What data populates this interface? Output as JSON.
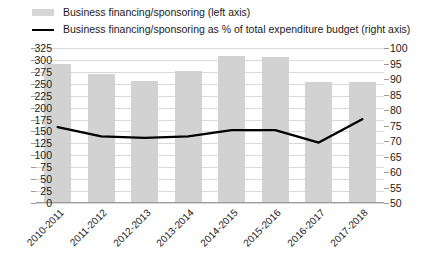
{
  "legend": {
    "items": [
      {
        "label": "Business financing/sponsoring (left axis)",
        "marker": "bar-swatch-icon",
        "color": "#d6d6d6"
      },
      {
        "label": "Business financing/sponsoring as % of total expenditure budget (right axis)",
        "marker": "line-swatch-icon",
        "color": "#000000"
      }
    ]
  },
  "chart_data": {
    "type": "bar",
    "title": "",
    "xlabel": "",
    "ylabel": "",
    "categories": [
      "2010-2011",
      "2011-2012",
      "2012-2013",
      "2013-2014",
      "2014-2015",
      "2015-2016",
      "2016-2017",
      "2017-2018"
    ],
    "series": [
      {
        "name": "Business financing/sponsoring (left axis)",
        "type": "bar",
        "axis": "left",
        "color": "#d2d2d2",
        "values": [
          292,
          270,
          256,
          277,
          308,
          307,
          253,
          253
        ]
      },
      {
        "name": "Business financing/sponsoring as % of total expenditure budget (right axis)",
        "type": "line",
        "axis": "right",
        "color": "#000000",
        "values": [
          74.5,
          71.5,
          71.0,
          71.5,
          73.5,
          73.5,
          69.5,
          77.0
        ]
      }
    ],
    "left_axis": {
      "ylim": [
        0,
        325
      ],
      "ticks": [
        325,
        300,
        275,
        250,
        225,
        200,
        175,
        150,
        125,
        100,
        75,
        50,
        25,
        0
      ]
    },
    "right_axis": {
      "ylim": [
        50,
        100
      ],
      "ticks": [
        100,
        95,
        90,
        85,
        80,
        75,
        70,
        65,
        60,
        55,
        50
      ]
    },
    "grid": true,
    "legend_position": "top-left"
  }
}
